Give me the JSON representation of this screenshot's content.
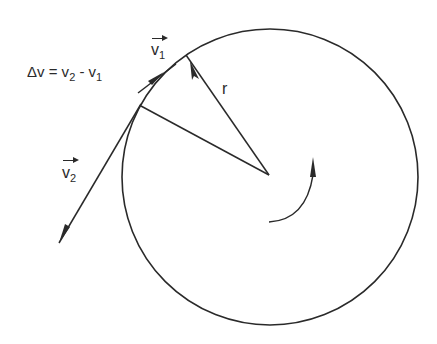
{
  "figure": {
    "equation": {
      "lhs": "Δv = v",
      "sub2": "2",
      "mid": " - v",
      "sub1": "1"
    },
    "v1_label": {
      "letter": "v",
      "subscript": "1"
    },
    "v2_label": {
      "letter": "v",
      "subscript": "2"
    },
    "radius_label": "r",
    "rotation_direction": "counterclockwise",
    "colors": {
      "stroke": "#2a2a2a",
      "background": "#ffffff"
    }
  }
}
